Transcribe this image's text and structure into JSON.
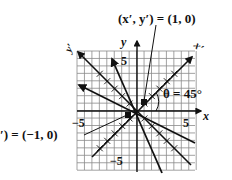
{
  "figure": {
    "labels": {
      "point_top": "(x′, y′) = (1, 0)",
      "point_left": "′) = (−1, 0)",
      "angle": "θ = 45°",
      "x_axis": "x",
      "y_axis": "y",
      "x_prime_axis": "x′",
      "y_prime_axis": "y′",
      "tick_x_pos": "5",
      "tick_x_neg": "−5",
      "tick_y_pos": "5",
      "tick_y_neg": "−5"
    },
    "colors": {
      "ink": "#111111",
      "grid": "#888888",
      "background": "#ffffff"
    },
    "rotation_angle_deg": 45
  }
}
